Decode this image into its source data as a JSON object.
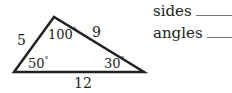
{
  "triangle": {
    "sides": {
      "left": "5",
      "right": "9",
      "bottom": "12"
    },
    "angles": {
      "top": "100",
      "bottom_left": "50",
      "bottom_right": "30"
    },
    "degree_symbol": "°",
    "vertices": {
      "top": [
        54,
        17
      ],
      "bottom_left": [
        14,
        72
      ],
      "bottom_right": [
        144,
        72
      ]
    },
    "stroke_color": "#222222"
  },
  "questions": [
    {
      "label": "sides",
      "answer": ""
    },
    {
      "label": "angles",
      "answer": ""
    }
  ]
}
